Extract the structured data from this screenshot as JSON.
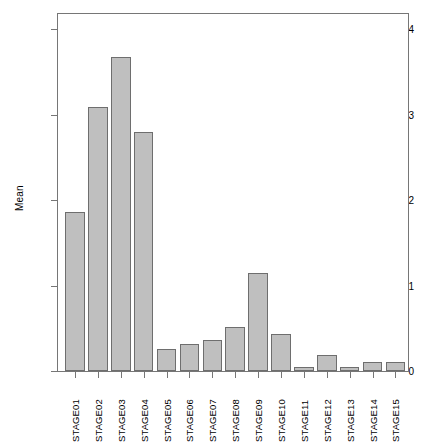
{
  "chart_data": {
    "type": "bar",
    "title": "",
    "xlabel": "",
    "ylabel": "Mean",
    "categories": [
      "STAGE01",
      "STAGE02",
      "STAGE03",
      "STAGE04",
      "STAGE05",
      "STAGE06",
      "STAGE07",
      "STAGE08",
      "STAGE09",
      "STAGE10",
      "STAGE11",
      "STAGE12",
      "STAGE13",
      "STAGE14",
      "STAGE15"
    ],
    "values": [
      1.86,
      3.09,
      3.67,
      2.8,
      0.26,
      0.32,
      0.36,
      0.51,
      1.15,
      0.43,
      0.05,
      0.19,
      0.05,
      0.1,
      0.1
    ],
    "ylim": [
      0,
      4.2
    ],
    "ytick_labels": [
      "0",
      "1",
      "2",
      "3",
      "4"
    ],
    "ytick_values": [
      0,
      1,
      2,
      3,
      4
    ],
    "grid": false,
    "legend": null,
    "bar_fill_color": "#bfbfbf",
    "bar_border_color": "#6e6e6e",
    "axis_color": "#767676",
    "background_color": "#ffffff"
  }
}
